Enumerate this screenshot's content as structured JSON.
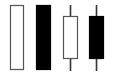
{
  "diagram": {
    "type": "candlestick-shapes",
    "colors": {
      "background": "#ffffff",
      "hollow_border": "#555555",
      "filled": "#000000",
      "wick": "#333333"
    },
    "candles": [
      {
        "name": "hollow-no-wick",
        "style": "hollow",
        "body": {
          "x": 10,
          "y": 5,
          "w": 14,
          "h": 65
        },
        "wick": null
      },
      {
        "name": "filled-no-wick",
        "style": "filled",
        "body": {
          "x": 36,
          "y": 5,
          "w": 15,
          "h": 65
        },
        "wick": null
      },
      {
        "name": "hollow-with-wick",
        "style": "hollow",
        "body": {
          "x": 63,
          "y": 16,
          "w": 15,
          "h": 43
        },
        "wick": {
          "x": 70,
          "y1": 5,
          "y2": 71
        }
      },
      {
        "name": "filled-with-wick",
        "style": "filled",
        "body": {
          "x": 89,
          "y": 16,
          "w": 15,
          "h": 43
        },
        "wick": {
          "x": 96,
          "y1": 5,
          "y2": 71
        }
      }
    ]
  }
}
